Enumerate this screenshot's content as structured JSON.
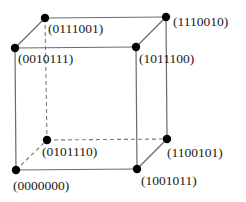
{
  "diagram": {
    "type": "hypercube-projection-cube",
    "colors": {
      "edge": "#6a6a6a",
      "vertex": "#000000",
      "label": "#1a1a1a",
      "background": "#ffffff"
    },
    "vertices": [
      {
        "id": "btl",
        "label": "(0111001)",
        "x": 45,
        "y": 18,
        "lx": 48,
        "ly": 33
      },
      {
        "id": "ftl",
        "label": "(0010111)",
        "x": 15,
        "y": 48,
        "lx": 18,
        "ly": 63
      },
      {
        "id": "btr",
        "label": "(1110010)",
        "x": 166,
        "y": 17,
        "lx": 173,
        "ly": 26
      },
      {
        "id": "ftr",
        "label": "(1011100)",
        "x": 136,
        "y": 47,
        "lx": 139,
        "ly": 63
      },
      {
        "id": "bbl",
        "label": "(0101110)",
        "x": 47,
        "y": 140,
        "lx": 42,
        "ly": 156
      },
      {
        "id": "fbl",
        "label": "(0000000)",
        "x": 16,
        "y": 170,
        "lx": 13,
        "ly": 190
      },
      {
        "id": "bbr",
        "label": "(1100101)",
        "x": 167,
        "y": 139,
        "lx": 167,
        "ly": 157
      },
      {
        "id": "fbr",
        "label": "(1001011)",
        "x": 137,
        "y": 169,
        "lx": 141,
        "ly": 185
      }
    ],
    "edges": [
      {
        "from": "ftl",
        "to": "ftr",
        "style": "solid"
      },
      {
        "from": "ftr",
        "to": "fbr",
        "style": "solid"
      },
      {
        "from": "fbr",
        "to": "fbl",
        "style": "solid"
      },
      {
        "from": "fbl",
        "to": "ftl",
        "style": "solid"
      },
      {
        "from": "btl",
        "to": "btr",
        "style": "solid"
      },
      {
        "from": "btr",
        "to": "bbr",
        "style": "solid"
      },
      {
        "from": "ftl",
        "to": "btl",
        "style": "solid"
      },
      {
        "from": "ftr",
        "to": "btr",
        "style": "solid"
      },
      {
        "from": "fbr",
        "to": "bbr",
        "style": "solid"
      },
      {
        "from": "btl",
        "to": "bbl",
        "style": "dashed"
      },
      {
        "from": "bbl",
        "to": "bbr",
        "style": "dashed"
      },
      {
        "from": "fbl",
        "to": "bbl",
        "style": "dashed"
      }
    ]
  }
}
